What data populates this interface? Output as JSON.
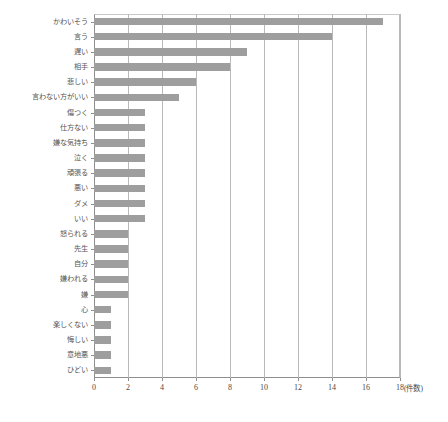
{
  "chart_data": {
    "type": "bar",
    "orientation": "horizontal",
    "title": "",
    "xlabel": "(件数)",
    "ylabel": "",
    "xlim": [
      0,
      18
    ],
    "xticks": [
      0,
      2,
      4,
      6,
      8,
      10,
      12,
      14,
      16,
      18
    ],
    "grid": true,
    "legend": false,
    "bar_color": "#9e9e9e",
    "axis_color": "#8e8e8e",
    "categories": [
      "かわいそう",
      "言う",
      "遅い",
      "相手",
      "悲しい",
      "言わない方がいい",
      "傷つく",
      "仕方ない",
      "嫌な気持ち",
      "泣く",
      "頑張る",
      "悪い",
      "ダメ",
      "いい",
      "怒られる",
      "先生",
      "自分",
      "嫌われる",
      "嫌",
      "心",
      "楽しくない",
      "悔しい",
      "意地悪",
      "ひどい"
    ],
    "values": [
      17,
      14,
      9,
      8,
      6,
      5,
      3,
      3,
      3,
      3,
      3,
      3,
      3,
      3,
      2,
      2,
      2,
      2,
      2,
      1,
      1,
      1,
      1,
      1
    ]
  }
}
